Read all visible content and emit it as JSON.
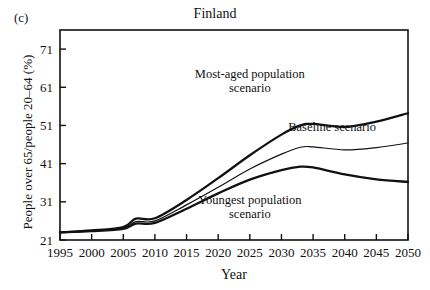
{
  "panel": {
    "label": "(c)"
  },
  "chart_data": {
    "type": "line",
    "title": "Finland",
    "xlabel": "Year",
    "ylabel": "People over 65/people 20–64 (%)",
    "xlim": [
      1995,
      2050
    ],
    "ylim": [
      21,
      76
    ],
    "grid": false,
    "legend_position": "inline-annotations",
    "xticks": [
      1995,
      2000,
      2005,
      2010,
      2015,
      2020,
      2025,
      2030,
      2035,
      2040,
      2045,
      2050
    ],
    "yticks": [
      21,
      31,
      41,
      51,
      61,
      71
    ],
    "x": [
      1995,
      2000,
      2005,
      2007,
      2010,
      2015,
      2020,
      2025,
      2030,
      2033,
      2035,
      2040,
      2045,
      2050
    ],
    "series": [
      {
        "name": "Most-aged population scenario",
        "values": [
          23.0,
          23.5,
          24.4,
          26.6,
          26.7,
          31.5,
          37.2,
          43.2,
          48.6,
          51.0,
          51.4,
          50.6,
          52.0,
          54.2
        ],
        "style": "thick",
        "annotation": {
          "lines": [
            "Most-aged population",
            "scenario"
          ],
          "x": 2025,
          "y": 63.5
        }
      },
      {
        "name": "Baseline scenario",
        "values": [
          23.0,
          23.4,
          24.1,
          25.8,
          26.0,
          30.2,
          34.8,
          39.6,
          43.5,
          45.3,
          45.4,
          44.6,
          45.2,
          46.4
        ],
        "style": "thin",
        "annotation": {
          "lines": [
            "Baseline scenario"
          ],
          "x": 2038,
          "y": 49.6
        }
      },
      {
        "name": "Youngest population scenario",
        "values": [
          23.0,
          23.3,
          23.9,
          25.3,
          25.5,
          29.2,
          33.2,
          36.8,
          39.3,
          40.2,
          40.0,
          38.2,
          36.9,
          36.2
        ],
        "style": "thick",
        "annotation": {
          "lines": [
            "Youngest population",
            "scenario"
          ],
          "x": 2025,
          "y": 30.3
        }
      }
    ]
  }
}
